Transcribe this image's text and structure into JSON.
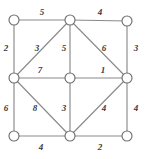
{
  "figure": {
    "type": "weighted-undirected-graph",
    "width": 145,
    "height": 159,
    "background_color": "#ffffff",
    "edge_color": "#8a8a8a",
    "vertex_fill_color": "#ffffff",
    "vertex_stroke_color": "#6f6f6f",
    "label_color": "#3a3a3a"
  },
  "chart_data": {
    "type": "diagram",
    "title": "",
    "vertices": [
      {
        "id": "top-left",
        "label": "",
        "x": 14,
        "y": 20,
        "r": 5
      },
      {
        "id": "top-middle",
        "label": "",
        "x": 70,
        "y": 20,
        "r": 5
      },
      {
        "id": "top-right",
        "label": "",
        "x": 127,
        "y": 21,
        "r": 5
      },
      {
        "id": "left-middle",
        "label": "",
        "x": 14,
        "y": 78,
        "r": 5
      },
      {
        "id": "center",
        "label": "",
        "x": 70,
        "y": 78,
        "r": 5
      },
      {
        "id": "right-middle",
        "label": "",
        "x": 127,
        "y": 78,
        "r": 5
      },
      {
        "id": "bottom-left",
        "label": "",
        "x": 14,
        "y": 136,
        "r": 5
      },
      {
        "id": "bottom-middle",
        "label": "",
        "x": 70,
        "y": 136,
        "r": 5
      },
      {
        "id": "bottom-right",
        "label": "",
        "x": 127,
        "y": 136,
        "r": 5
      }
    ],
    "edges": [
      {
        "id": "e-tl-tm",
        "from": "top-left",
        "to": "top-middle",
        "weight": "5",
        "label_x": 42,
        "label_y": 12
      },
      {
        "id": "e-tm-tr",
        "from": "top-middle",
        "to": "top-right",
        "weight": "4",
        "label_x": 100,
        "label_y": 12
      },
      {
        "id": "e-tl-lm",
        "from": "top-left",
        "to": "left-middle",
        "weight": "2",
        "label_x": 6,
        "label_y": 48
      },
      {
        "id": "e-tr-rm",
        "from": "top-right",
        "to": "right-middle",
        "weight": "3",
        "label_x": 136,
        "label_y": 48
      },
      {
        "id": "e-lm-tm",
        "from": "left-middle",
        "to": "top-middle",
        "weight": "3",
        "label_x": 37,
        "label_y": 48
      },
      {
        "id": "e-tm-c",
        "from": "top-middle",
        "to": "center",
        "weight": "5",
        "label_x": 64,
        "label_y": 48
      },
      {
        "id": "e-tm-rm",
        "from": "top-middle",
        "to": "right-middle",
        "weight": "6",
        "label_x": 104,
        "label_y": 48
      },
      {
        "id": "e-lm-c",
        "from": "left-middle",
        "to": "center",
        "weight": "7",
        "label_x": 40,
        "label_y": 70
      },
      {
        "id": "e-c-rm",
        "from": "center",
        "to": "right-middle",
        "weight": "1",
        "label_x": 103,
        "label_y": 70
      },
      {
        "id": "e-lm-bl",
        "from": "left-middle",
        "to": "bottom-left",
        "weight": "6",
        "label_x": 6,
        "label_y": 108
      },
      {
        "id": "e-lm-bm",
        "from": "left-middle",
        "to": "bottom-middle",
        "weight": "8",
        "label_x": 35,
        "label_y": 108
      },
      {
        "id": "e-c-bm",
        "from": "center",
        "to": "bottom-middle",
        "weight": "3",
        "label_x": 64,
        "label_y": 108
      },
      {
        "id": "e-bm-rm",
        "from": "bottom-middle",
        "to": "right-middle",
        "weight": "4",
        "label_x": 104,
        "label_y": 108
      },
      {
        "id": "e-rm-br",
        "from": "right-middle",
        "to": "bottom-right",
        "weight": "4",
        "label_x": 136,
        "label_y": 108
      },
      {
        "id": "e-bl-bm",
        "from": "bottom-left",
        "to": "bottom-middle",
        "weight": "4",
        "label_x": 41,
        "label_y": 147
      },
      {
        "id": "e-bm-br",
        "from": "bottom-middle",
        "to": "bottom-right",
        "weight": "2",
        "label_x": 100,
        "label_y": 147
      }
    ]
  }
}
